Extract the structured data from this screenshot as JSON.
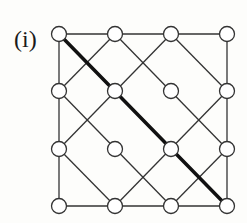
{
  "figure": {
    "label": "(i)",
    "colors": {
      "background": "#fdfdfb",
      "stroke": "#333333",
      "highlight": "#111111",
      "node_fill": "#ffffff"
    },
    "grid": {
      "cols": 4,
      "rows": 4,
      "x": [
        59,
        115,
        171,
        227
      ],
      "y": [
        34,
        91,
        149,
        206
      ],
      "node_radius": 7.5
    },
    "nodes": [
      [
        0,
        0
      ],
      [
        1,
        0
      ],
      [
        2,
        0
      ],
      [
        3,
        0
      ],
      [
        0,
        1
      ],
      [
        1,
        1
      ],
      [
        2,
        1
      ],
      [
        3,
        1
      ],
      [
        0,
        2
      ],
      [
        1,
        2
      ],
      [
        2,
        2
      ],
      [
        3,
        2
      ],
      [
        0,
        3
      ],
      [
        1,
        3
      ],
      [
        2,
        3
      ],
      [
        3,
        3
      ]
    ],
    "edges": [
      {
        "from": [
          0,
          0
        ],
        "to": [
          3,
          0
        ],
        "type": "border-top"
      },
      {
        "from": [
          0,
          3
        ],
        "to": [
          3,
          3
        ],
        "type": "border-bottom"
      },
      {
        "from": [
          0,
          0
        ],
        "to": [
          0,
          3
        ],
        "type": "border-left"
      },
      {
        "from": [
          3,
          0
        ],
        "to": [
          3,
          3
        ],
        "type": "border-right"
      },
      {
        "from": [
          1,
          0
        ],
        "to": [
          3,
          2
        ],
        "type": "diagonal"
      },
      {
        "from": [
          0,
          1
        ],
        "to": [
          2,
          3
        ],
        "type": "diagonal"
      },
      {
        "from": [
          2,
          0
        ],
        "to": [
          3,
          1
        ],
        "type": "diagonal"
      },
      {
        "from": [
          0,
          2
        ],
        "to": [
          1,
          3
        ],
        "type": "diagonal"
      },
      {
        "from": [
          1,
          0
        ],
        "to": [
          0,
          1
        ],
        "type": "diagonal"
      },
      {
        "from": [
          2,
          0
        ],
        "to": [
          0,
          2
        ],
        "type": "diagonal"
      },
      {
        "from": [
          3,
          1
        ],
        "to": [
          1,
          3
        ],
        "type": "diagonal"
      },
      {
        "from": [
          3,
          2
        ],
        "to": [
          2,
          3
        ],
        "type": "diagonal"
      }
    ],
    "highlight_path": {
      "from": [
        0,
        0
      ],
      "to": [
        3,
        3
      ],
      "width": 3.5
    }
  }
}
